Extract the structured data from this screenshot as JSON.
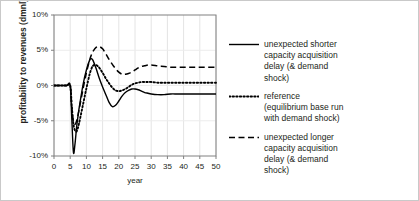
{
  "chart_data": {
    "type": "line",
    "title": "",
    "xlabel": "year",
    "ylabel": "profitability to revenues (dmnl)",
    "xlim": [
      0,
      50
    ],
    "ylim": [
      -0.1,
      0.1
    ],
    "grid": true,
    "legend_position": "right",
    "xticks": [
      "0",
      "5",
      "10",
      "15",
      "20",
      "25",
      "30",
      "35",
      "40",
      "45",
      "50"
    ],
    "xtick_values": [
      0,
      5,
      10,
      15,
      20,
      25,
      30,
      35,
      40,
      45,
      50
    ],
    "yticks": [
      "10%",
      "5%",
      "0%",
      "-5%",
      "-10%"
    ],
    "ytick_values": [
      0.1,
      0.05,
      0.0,
      -0.05,
      -0.1
    ],
    "x": [
      0,
      1,
      2,
      3,
      4,
      5,
      5.5,
      6,
      6.5,
      7,
      7.5,
      8,
      9,
      10,
      11,
      11.5,
      12,
      13,
      14,
      15,
      16,
      17,
      18,
      19,
      20,
      21,
      22,
      23,
      24,
      25,
      26,
      27,
      28,
      29,
      30,
      32,
      34,
      36,
      38,
      40,
      42,
      44,
      46,
      48,
      50
    ],
    "series": [
      {
        "name": "unexpected shorter capacity acquisition delay (& demand shock)",
        "style": "solid",
        "color": "#000000",
        "values": [
          0,
          0,
          0,
          0,
          0,
          0,
          -0.048,
          -0.095,
          -0.082,
          -0.058,
          -0.04,
          -0.025,
          0.002,
          0.022,
          0.036,
          0.038,
          0.036,
          0.024,
          0.01,
          -0.002,
          -0.013,
          -0.024,
          -0.03,
          -0.028,
          -0.022,
          -0.015,
          -0.01,
          -0.007,
          -0.005,
          -0.005,
          -0.006,
          -0.008,
          -0.01,
          -0.011,
          -0.012,
          -0.013,
          -0.013,
          -0.012,
          -0.012,
          -0.012,
          -0.012,
          -0.012,
          -0.012,
          -0.012,
          -0.012
        ]
      },
      {
        "name": "reference (equilibrium base run with demand shock)",
        "style": "dotted",
        "color": "#000000",
        "values": [
          0,
          0,
          0,
          0,
          0,
          0,
          -0.03,
          -0.055,
          -0.064,
          -0.065,
          -0.058,
          -0.048,
          -0.026,
          -0.004,
          0.016,
          0.023,
          0.028,
          0.029,
          0.025,
          0.018,
          0.01,
          0.003,
          -0.003,
          -0.007,
          -0.008,
          -0.007,
          -0.005,
          -0.002,
          0.001,
          0.003,
          0.004,
          0.005,
          0.005,
          0.005,
          0.005,
          0.004,
          0.004,
          0.004,
          0.004,
          0.004,
          0.004,
          0.004,
          0.004,
          0.004,
          0.004
        ]
      },
      {
        "name": "unexpected longer capacity acquisition delay (& demand shock)",
        "style": "dashed",
        "color": "#000000",
        "values": [
          0,
          0,
          0,
          0,
          0,
          0,
          -0.032,
          -0.052,
          -0.055,
          -0.05,
          -0.04,
          -0.028,
          -0.004,
          0.018,
          0.036,
          0.043,
          0.048,
          0.054,
          0.055,
          0.052,
          0.045,
          0.037,
          0.03,
          0.024,
          0.019,
          0.016,
          0.016,
          0.017,
          0.019,
          0.022,
          0.025,
          0.027,
          0.028,
          0.029,
          0.029,
          0.028,
          0.027,
          0.026,
          0.026,
          0.026,
          0.026,
          0.026,
          0.026,
          0.026,
          0.026
        ]
      }
    ]
  },
  "legend": {
    "entries": [
      {
        "style": "solid",
        "label": "unexpected shorter\ncapacity acquisition\ndelay (& demand\nshock)"
      },
      {
        "style": "dotted",
        "label": "reference\n(equilibrium base run\nwith demand shock)"
      },
      {
        "style": "dashed",
        "label": "unexpected longer\ncapacity acquisition\ndelay (& demand\nshock)"
      }
    ]
  }
}
